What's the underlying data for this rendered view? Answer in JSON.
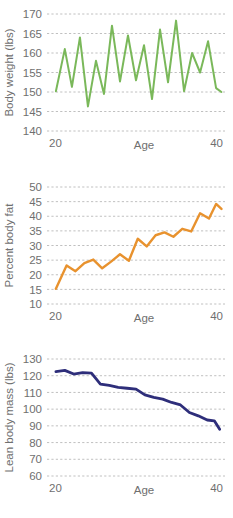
{
  "figure": {
    "layout": "three stacked line charts sharing an Age x-axis",
    "background_color": "#ffffff",
    "text_color": "#6f6f6f",
    "grid_color": "#b9b9b9",
    "grid_style": "dashed horizontal gridlines only"
  },
  "chart_data": [
    {
      "type": "line",
      "title": "",
      "xlabel": "Age",
      "ylabel": "Body weight (lbs)",
      "color": "#7ab85a",
      "xlim": [
        20,
        40
      ],
      "ylim": [
        140,
        170
      ],
      "xticks": [
        20,
        40
      ],
      "xticklabels": [
        "20",
        "40"
      ],
      "yticks": [
        140,
        145,
        150,
        155,
        160,
        165,
        170
      ],
      "yticklabels": [
        "140",
        "145",
        "150",
        "155",
        "160",
        "165",
        "170"
      ],
      "grid": true,
      "legend": "none",
      "x": [
        21.0,
        22.0,
        22.8,
        23.7,
        24.6,
        25.5,
        26.4,
        27.3,
        28.2,
        29.1,
        30.0,
        30.9,
        31.8,
        32.7,
        33.6,
        34.5,
        35.4,
        36.3,
        37.2,
        38.1,
        39.0,
        39.6
      ],
      "y": [
        150.2,
        161.0,
        151.3,
        164.0,
        146.3,
        158.0,
        149.5,
        167.0,
        152.7,
        164.5,
        153.0,
        162.0,
        148.2,
        166.0,
        152.5,
        168.3,
        150.2,
        160.0,
        155.0,
        163.0,
        151.0,
        150.0
      ]
    },
    {
      "type": "line",
      "title": "",
      "xlabel": "Age",
      "ylabel": "Percent body fat",
      "color": "#e8922e",
      "xlim": [
        20,
        40
      ],
      "ylim": [
        10,
        50
      ],
      "xticks": [
        20,
        40
      ],
      "xticklabels": [
        "20",
        "40"
      ],
      "yticks": [
        10,
        15,
        20,
        25,
        30,
        35,
        40,
        45,
        50
      ],
      "yticklabels": [
        "10",
        "15",
        "20",
        "25",
        "30",
        "35",
        "40",
        "45",
        "50"
      ],
      "grid": true,
      "legend": "none",
      "x": [
        21.0,
        22.2,
        23.2,
        24.2,
        25.2,
        26.2,
        27.2,
        28.2,
        29.2,
        30.2,
        31.2,
        32.2,
        33.2,
        34.2,
        35.2,
        36.2,
        37.2,
        38.2,
        39.0,
        39.6
      ],
      "y": [
        15.2,
        23.2,
        21.2,
        24.0,
        25.2,
        22.2,
        24.5,
        27.0,
        24.8,
        32.3,
        29.7,
        33.5,
        34.5,
        33.0,
        35.7,
        34.8,
        41.0,
        39.2,
        44.2,
        42.5
      ]
    },
    {
      "type": "line",
      "title": "",
      "xlabel": "Age",
      "ylabel": "Lean body mass (lbs)",
      "color": "#2e2e7a",
      "xlim": [
        20,
        40
      ],
      "ylim": [
        60,
        130
      ],
      "xticks": [
        20,
        40
      ],
      "xticklabels": [
        "20",
        "40"
      ],
      "yticks": [
        60,
        70,
        80,
        90,
        100,
        110,
        120,
        130
      ],
      "yticklabels": [
        "60",
        "70",
        "80",
        "90",
        "100",
        "110",
        "120",
        "130"
      ],
      "grid": true,
      "legend": "none",
      "x": [
        21.0,
        22.0,
        23.0,
        24.0,
        25.0,
        26.0,
        27.0,
        28.0,
        29.0,
        30.0,
        31.0,
        32.0,
        33.0,
        34.0,
        35.0,
        36.0,
        37.0,
        38.0,
        38.8,
        39.4
      ],
      "y": [
        122.5,
        123.2,
        121.0,
        121.8,
        121.5,
        115.0,
        114.2,
        113.0,
        112.5,
        112.0,
        108.5,
        107.0,
        106.0,
        104.0,
        102.5,
        98.0,
        96.0,
        93.5,
        93.0,
        88.0
      ]
    }
  ]
}
